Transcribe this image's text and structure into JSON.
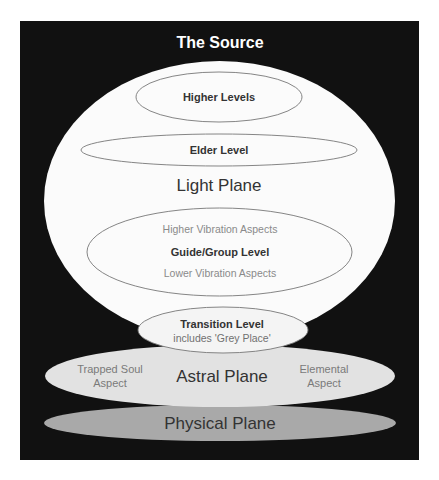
{
  "diagram": {
    "title": "The Source",
    "colors": {
      "background": "#111111",
      "light_plane": "#fbfbfb",
      "astral_plane": "#e2e2e2",
      "physical_plane": "#a9a9a9",
      "outline": "#777777"
    },
    "light_plane": {
      "label": "Light Plane",
      "higher_levels": {
        "label": "Higher Levels"
      },
      "elder_level": {
        "label": "Elder Level"
      },
      "guide_group": {
        "upper": "Higher Vibration Aspects",
        "label": "Guide/Group Level",
        "lower": "Lower Vibration Aspects"
      }
    },
    "transition": {
      "label": "Transition Level",
      "sub": "includes 'Grey Place'"
    },
    "astral_plane": {
      "label": "Astral Plane",
      "left_line1": "Trapped Soul",
      "left_line2": "Aspect",
      "right_line1": "Elemental",
      "right_line2": "Aspect"
    },
    "physical_plane": {
      "label": "Physical Plane"
    }
  }
}
